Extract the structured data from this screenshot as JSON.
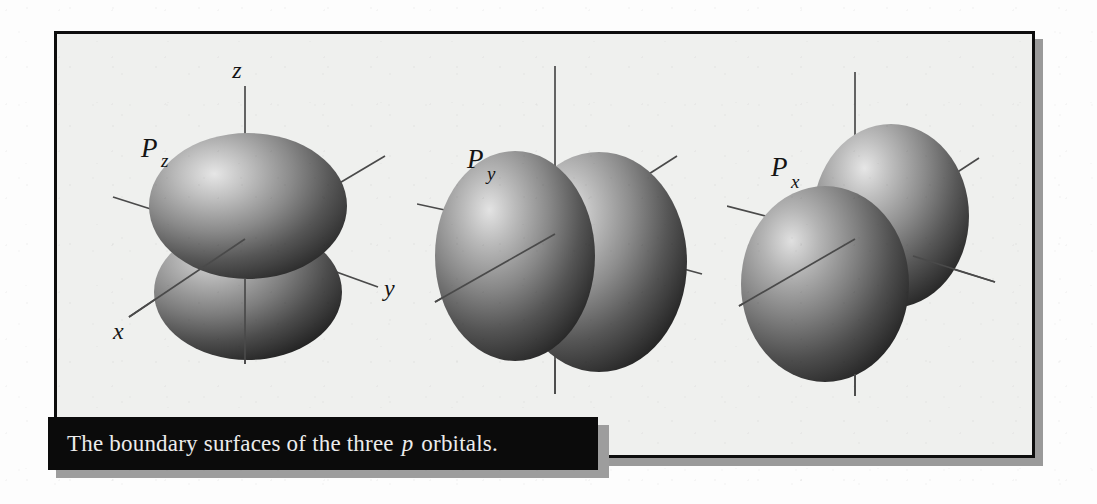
{
  "figure": {
    "caption": {
      "text_before": "The boundary surfaces of the three",
      "emphasis": "p",
      "text_after": "orbitals.",
      "full_text": "The boundary surfaces of the three p orbitals."
    },
    "frame_color": "#0d0d0d",
    "panel_color": "#eff0ee",
    "shadow_color": "#9a9a9a",
    "caption_bar_color": "#0b0b0b",
    "caption_text_color": "#ececec",
    "orbital_fill_light": "#d8d8d8",
    "orbital_fill_dark": "#2b2b2b",
    "axis_color": "#4a4a4a"
  },
  "orbitals": [
    {
      "id": "pz",
      "label_main": "P",
      "label_sub": "z",
      "label_full": "Pz",
      "orientation": "vertical",
      "axes": [
        {
          "name": "z",
          "label": "z",
          "shown": true
        },
        {
          "name": "y",
          "label": "y",
          "shown": true
        },
        {
          "name": "x",
          "label": "x",
          "shown": true
        }
      ]
    },
    {
      "id": "py",
      "label_main": "P",
      "label_sub": "y",
      "label_full": "Py",
      "orientation": "horizontal-y",
      "axes": [
        {
          "name": "z",
          "label": "",
          "shown": false
        },
        {
          "name": "y",
          "label": "",
          "shown": false
        },
        {
          "name": "x",
          "label": "",
          "shown": false
        }
      ]
    },
    {
      "id": "px",
      "label_main": "P",
      "label_sub": "x",
      "label_full": "Px",
      "orientation": "depth-x",
      "axes": [
        {
          "name": "z",
          "label": "",
          "shown": false
        },
        {
          "name": "y",
          "label": "",
          "shown": false
        },
        {
          "name": "x",
          "label": "",
          "shown": false
        }
      ]
    }
  ]
}
